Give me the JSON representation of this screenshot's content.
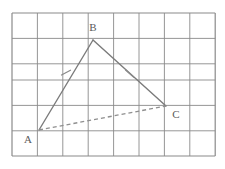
{
  "figure": {
    "background_color": "#ffffff"
  },
  "grid": {
    "name": "square-grid",
    "x0": 12,
    "y0": 13,
    "cell_size": 25.4,
    "cols": 8,
    "rows": 5.6,
    "line_color": "#8a8a8a",
    "line_width": 1,
    "border_color": "#8a8a8a",
    "border_width": 1.2
  },
  "geometry": {
    "stroke_color": "#7b7b7b",
    "dash_color": "#8f8f8f",
    "stroke_width": 1.3,
    "points": [
      {
        "id": "A",
        "label": "A",
        "x": 39,
        "y": 130,
        "label_x": 28,
        "label_y": 143
      },
      {
        "id": "B",
        "label": "B",
        "x": 93,
        "y": 40,
        "label_x": 89,
        "label_y": 31
      },
      {
        "id": "C",
        "label": "C",
        "x": 166,
        "y": 106,
        "label_x": 173,
        "label_y": 118
      }
    ],
    "segments": [
      {
        "id": "AB",
        "from": "A",
        "to": "B",
        "style": "solid",
        "tick_marks": 1
      },
      {
        "id": "BC",
        "from": "B",
        "to": "C",
        "style": "solid",
        "tick_marks": 1
      },
      {
        "id": "AC",
        "from": "A",
        "to": "C",
        "style": "dashed",
        "tick_marks": 0
      }
    ],
    "tick_marks": [
      {
        "id": "tick-AB",
        "on_segment": "AB",
        "x": 66,
        "y": 78,
        "angle": -28,
        "length": 9
      },
      {
        "id": "tick-BC",
        "on_segment": "BC",
        "x": 130,
        "y": 74,
        "angle": 48,
        "length": 9
      }
    ],
    "dash_pattern": "4 3"
  }
}
